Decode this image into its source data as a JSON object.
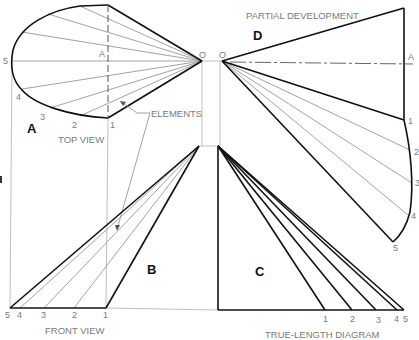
{
  "views": {
    "top": {
      "letter": "A",
      "caption": "TOP VIEW",
      "apex_label": "O",
      "axis_label": "A",
      "points": [
        "1",
        "2",
        "3",
        "4",
        "5"
      ]
    },
    "front": {
      "letter": "B",
      "caption": "FRONT VIEW",
      "points": [
        "5",
        "4",
        "3",
        "2",
        "1"
      ]
    },
    "true_length": {
      "letter": "C",
      "caption": "TRUE-LENGTH DIAGRAM",
      "points": [
        "1",
        "2",
        "3",
        "4",
        "5"
      ]
    },
    "development": {
      "letter": "D",
      "caption": "PARTIAL DEVELOPMENT",
      "apex_label": "O",
      "axis_label": "A",
      "points": [
        "1",
        "2",
        "3",
        "4",
        "5"
      ]
    }
  },
  "callout": {
    "label": "ELEMENTS"
  },
  "colors": {
    "outline": "#111111",
    "elements": "#8a8a8a",
    "projection": "#b0b0b0",
    "text": "#7a7a7a"
  }
}
